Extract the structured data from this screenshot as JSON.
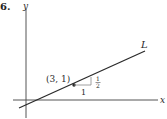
{
  "problem": {
    "number": "6."
  },
  "axes": {
    "x_label": "x",
    "y_label": "y"
  },
  "line": {
    "label": "L",
    "slope": "1/2",
    "point": {
      "label": "(3, 1)",
      "x": 3,
      "y": 1
    }
  },
  "slope_triangle": {
    "run_label": "1",
    "rise_numerator": "1",
    "rise_denominator": "2"
  },
  "colors": {
    "ink": "#2a2a2a",
    "axis": "#555555",
    "triangle": "#888888"
  }
}
